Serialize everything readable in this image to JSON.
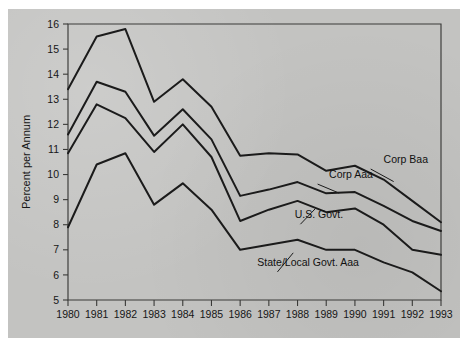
{
  "chart_data": {
    "type": "line",
    "title": "",
    "subtitle": "",
    "xlabel": "",
    "ylabel": "Percent per Annum",
    "x": [
      1980,
      1981,
      1982,
      1983,
      1984,
      1985,
      1986,
      1987,
      1988,
      1989,
      1990,
      1991,
      1992,
      1993
    ],
    "categories": [
      "1980",
      "1981",
      "1982",
      "1983",
      "1984",
      "1985",
      "1986",
      "1987",
      "1988",
      "1989",
      "1990",
      "1991",
      "1992",
      "1993"
    ],
    "xlim": [
      1980,
      1993
    ],
    "ylim": [
      5,
      16
    ],
    "yticks": [
      5,
      6,
      7,
      8,
      9,
      10,
      11,
      12,
      13,
      14,
      15,
      16
    ],
    "ytick_labels": [
      "5",
      "6",
      "7",
      "8",
      "9",
      "10",
      "11",
      "12",
      "13",
      "14",
      "15",
      "16"
    ],
    "grid": false,
    "legend_position": "inline-annotations",
    "series": [
      {
        "name": "Corp Baa",
        "label": "Corp Baa",
        "values": [
          13.4,
          15.5,
          15.8,
          12.9,
          13.8,
          12.7,
          10.75,
          10.85,
          10.8,
          10.15,
          10.35,
          9.8,
          8.95,
          8.1
        ]
      },
      {
        "name": "Corp Aaa",
        "label": "Corp Aaa",
        "values": [
          11.6,
          13.7,
          13.3,
          11.55,
          12.6,
          11.4,
          9.15,
          9.4,
          9.7,
          9.25,
          9.3,
          8.75,
          8.15,
          7.75
        ]
      },
      {
        "name": "U.S. Govt.",
        "label": "U.S. Govt.",
        "values": [
          10.85,
          12.8,
          12.25,
          10.9,
          12.0,
          10.7,
          8.15,
          8.6,
          8.95,
          8.5,
          8.65,
          8.0,
          7.0,
          6.8
        ]
      },
      {
        "name": "State/Local Govt. Aaa",
        "label": "State/Local Govt. Aaa",
        "values": [
          7.9,
          10.4,
          10.85,
          8.8,
          9.65,
          8.6,
          7.0,
          7.2,
          7.4,
          7.0,
          7.0,
          6.5,
          6.1,
          5.35
        ]
      }
    ],
    "annotations": [
      {
        "text": "Corp Baa",
        "x": 1991.0,
        "y": 10.45
      },
      {
        "text": "Corp Aaa",
        "x": 1989.1,
        "y": 9.85
      },
      {
        "text": "U.S. Govt.",
        "x": 1987.9,
        "y": 8.25
      },
      {
        "text": "State/Local Govt. Aaa",
        "x": 1986.6,
        "y": 6.35
      }
    ],
    "colors": {
      "line": "#1b1b1b",
      "axis": "#3a3a38",
      "plot_background": "#c3c3c1",
      "page_background": "#ffffff"
    }
  }
}
